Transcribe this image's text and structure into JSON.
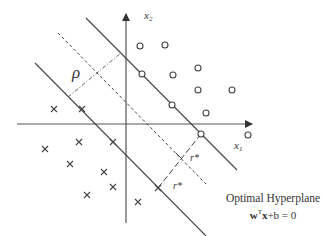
{
  "diagram": {
    "axes": {
      "x_label": "x",
      "x_sub": "1",
      "y_label": "x",
      "y_sub": "2"
    },
    "labels": {
      "margin": "ρ",
      "distance_upper": "r*",
      "distance_lower": "r*"
    },
    "caption": {
      "line1": "Optimal Hyperplane",
      "eq_w": "w",
      "eq_T": "T",
      "eq_x": "x",
      "eq_rest": "+b = 0"
    },
    "colors": {
      "line": "#444444",
      "text": "#333333",
      "background": "#ffffff"
    },
    "class_circle_points": [
      [
        140,
        46
      ],
      [
        165,
        45
      ],
      [
        142,
        74
      ],
      [
        173,
        75
      ],
      [
        198,
        68
      ],
      [
        198,
        90
      ],
      [
        232,
        90
      ],
      [
        172,
        105
      ],
      [
        206,
        113
      ],
      [
        201,
        134
      ],
      [
        248,
        135
      ]
    ],
    "class_cross_points": [
      [
        54,
        109
      ],
      [
        82,
        109
      ],
      [
        45,
        149
      ],
      [
        79,
        142
      ],
      [
        113,
        142
      ],
      [
        70,
        164
      ],
      [
        104,
        172
      ],
      [
        113,
        187
      ],
      [
        87,
        195
      ],
      [
        158,
        188
      ],
      [
        138,
        202
      ]
    ]
  }
}
